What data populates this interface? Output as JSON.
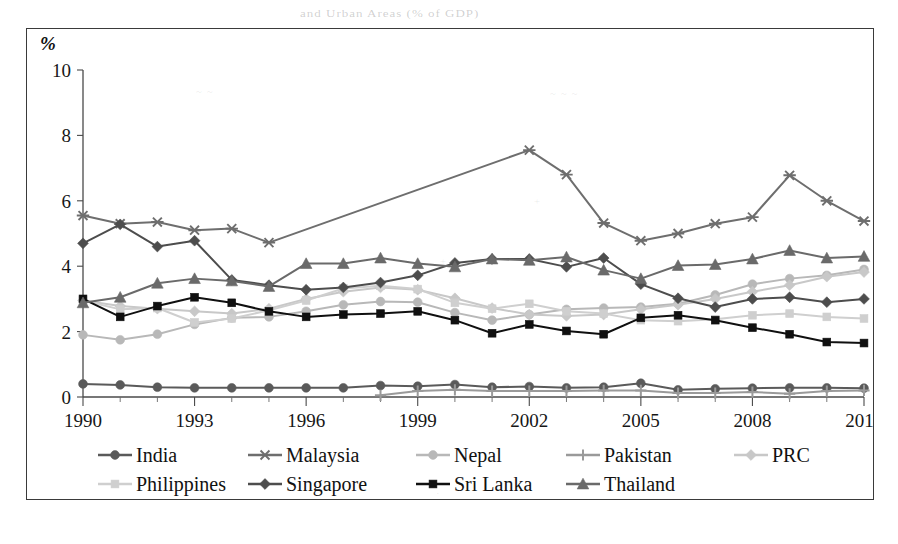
{
  "figure": {
    "percent_symbol": "%",
    "bleed_text": {
      "top": "and Urban Areas (% of GDP)",
      "a": "~ ~",
      "b": "~ ~ ~",
      "c": "+",
      "d": "+",
      "e": "·"
    }
  },
  "legend": {
    "rows": [
      [
        {
          "label": "India",
          "key": "India"
        },
        {
          "label": "Malaysia",
          "key": "Malaysia"
        },
        {
          "label": "Nepal",
          "key": "Nepal"
        },
        {
          "label": "Pakistan",
          "key": "Pakistan"
        },
        {
          "label": "PRC",
          "key": "PRC"
        }
      ],
      [
        {
          "label": "Philippines",
          "key": "Philippines"
        },
        {
          "label": "Singapore",
          "key": "Singapore"
        },
        {
          "label": "Sri Lanka",
          "key": "Sri Lanka"
        },
        {
          "label": "Thailand",
          "key": "Thailand"
        }
      ]
    ]
  },
  "chart_data": {
    "type": "line",
    "title": "",
    "subtitle": "",
    "xlabel": "",
    "ylabel": "%",
    "xlim": [
      1990,
      2011
    ],
    "ylim": [
      0,
      10
    ],
    "ytick_step": 2,
    "yticks": [
      0,
      2,
      4,
      6,
      8,
      10
    ],
    "xticks": [
      1990,
      1993,
      1996,
      1999,
      2002,
      2005,
      2008,
      2011
    ],
    "xtick_labels": [
      "1990",
      "1993",
      "1996",
      "1999",
      "2002",
      "2005",
      "2008",
      "2011"
    ],
    "xtick_minor_step": 1,
    "grid": false,
    "legend_position": "bottom",
    "x": [
      1990,
      1991,
      1992,
      1993,
      1994,
      1995,
      1996,
      1997,
      1998,
      1999,
      2000,
      2001,
      2002,
      2003,
      2004,
      2005,
      2006,
      2007,
      2008,
      2009,
      2010,
      2011
    ],
    "series": [
      {
        "name": "India",
        "color": "#5a5a5a",
        "marker": "circle",
        "x": [
          1990,
          1991,
          1992,
          1993,
          1994,
          1995,
          1996,
          1997,
          1998,
          1999,
          2000,
          2001,
          2002,
          2003,
          2004,
          2005,
          2006,
          2007,
          2008,
          2009,
          2010,
          2011
        ],
        "values": [
          0.4,
          0.37,
          0.3,
          0.28,
          0.28,
          0.28,
          0.28,
          0.28,
          0.35,
          0.33,
          0.38,
          0.3,
          0.32,
          0.28,
          0.3,
          0.42,
          0.22,
          0.25,
          0.27,
          0.28,
          0.28,
          0.27
        ]
      },
      {
        "name": "Malaysia",
        "color": "#6e6e6e",
        "marker": "asterisk",
        "x": [
          1990,
          1991,
          1992,
          1993,
          1994,
          1995,
          2002,
          2003,
          2004,
          2005,
          2006,
          2007,
          2008,
          2009,
          2010,
          2011
        ],
        "values": [
          5.55,
          5.3,
          5.35,
          5.1,
          5.15,
          4.72,
          7.55,
          6.8,
          5.32,
          4.78,
          5.0,
          5.3,
          5.5,
          6.78,
          6.0,
          5.38
        ]
      },
      {
        "name": "Nepal",
        "color": "#b8b8b8",
        "marker": "circle",
        "x": [
          1990,
          1991,
          1992,
          1993,
          1994,
          1995,
          1996,
          1997,
          1998,
          1999,
          2000,
          2001,
          2002,
          2003,
          2004,
          2005,
          2006,
          2007,
          2008,
          2009,
          2010,
          2011
        ],
        "values": [
          1.9,
          1.75,
          1.92,
          2.22,
          2.42,
          2.45,
          2.62,
          2.82,
          2.92,
          2.9,
          2.58,
          2.35,
          2.52,
          2.68,
          2.72,
          2.75,
          2.85,
          3.12,
          3.45,
          3.62,
          3.72,
          3.9
        ]
      },
      {
        "name": "Pakistan",
        "color": "#9a9a9a",
        "marker": "plus",
        "x": [
          1998,
          1999,
          2000,
          2001,
          2002,
          2003,
          2004,
          2005,
          2006,
          2007,
          2008,
          2009,
          2010,
          2011
        ],
        "values": [
          0.05,
          0.18,
          0.22,
          0.18,
          0.18,
          0.18,
          0.2,
          0.2,
          0.12,
          0.12,
          0.15,
          0.1,
          0.18,
          0.2
        ]
      },
      {
        "name": "PRC",
        "color": "#c8c8c8",
        "marker": "diamond",
        "x": [
          1990,
          1991,
          1992,
          1993,
          1994,
          1995,
          1996,
          1997,
          1998,
          1999,
          2000,
          2001,
          2002,
          2003,
          2004,
          2005,
          2006,
          2007,
          2008,
          2009,
          2010,
          2011
        ],
        "values": [
          2.95,
          2.78,
          2.7,
          2.62,
          2.55,
          2.7,
          3.0,
          3.22,
          3.35,
          3.28,
          3.02,
          2.72,
          2.52,
          2.48,
          2.52,
          2.68,
          2.82,
          3.0,
          3.22,
          3.42,
          3.68,
          3.82
        ]
      },
      {
        "name": "Philippines",
        "color": "#cfcfcf",
        "marker": "square",
        "x": [
          1990,
          1991,
          1992,
          1993,
          1994,
          1995,
          1996,
          1997,
          1998,
          1999,
          2000,
          2001,
          2002,
          2003,
          2004,
          2005,
          2006,
          2007,
          2008,
          2009,
          2010,
          2011
        ],
        "values": [
          2.95,
          2.68,
          2.72,
          2.28,
          2.4,
          2.65,
          2.95,
          3.32,
          3.4,
          3.3,
          2.88,
          2.7,
          2.85,
          2.62,
          2.55,
          2.35,
          2.32,
          2.38,
          2.5,
          2.55,
          2.45,
          2.4
        ]
      },
      {
        "name": "Singapore",
        "color": "#4d4d4d",
        "marker": "diamond",
        "x": [
          1990,
          1991,
          1992,
          1993,
          1994,
          1995,
          1996,
          1997,
          1998,
          1999,
          2000,
          2001,
          2002,
          2003,
          2004,
          2005,
          2006,
          2007,
          2008,
          2009,
          2010,
          2011
        ],
        "values": [
          4.7,
          5.28,
          4.6,
          4.78,
          3.58,
          3.42,
          3.28,
          3.35,
          3.5,
          3.72,
          4.1,
          4.22,
          4.22,
          3.98,
          4.25,
          3.45,
          3.02,
          2.75,
          3.0,
          3.05,
          2.9,
          3.0
        ]
      },
      {
        "name": "Sri Lanka",
        "color": "#101010",
        "marker": "square",
        "x": [
          1990,
          1991,
          1992,
          1993,
          1994,
          1995,
          1996,
          1997,
          1998,
          1999,
          2000,
          2001,
          2002,
          2003,
          2004,
          2005,
          2006,
          2007,
          2008,
          2009,
          2010,
          2011
        ],
        "values": [
          3.0,
          2.45,
          2.78,
          3.05,
          2.88,
          2.62,
          2.45,
          2.52,
          2.55,
          2.62,
          2.35,
          1.95,
          2.22,
          2.02,
          1.92,
          2.42,
          2.5,
          2.35,
          2.12,
          1.92,
          1.68,
          1.65
        ]
      },
      {
        "name": "Thailand",
        "color": "#6a6a6a",
        "marker": "triangle",
        "x": [
          1990,
          1991,
          1992,
          1993,
          1994,
          1995,
          1996,
          1997,
          1998,
          1999,
          2000,
          2001,
          2002,
          2003,
          2004,
          2005,
          2006,
          2007,
          2008,
          2009,
          2010,
          2011
        ],
        "values": [
          2.88,
          3.05,
          3.48,
          3.62,
          3.55,
          3.38,
          4.08,
          4.08,
          4.25,
          4.08,
          3.98,
          4.22,
          4.18,
          4.28,
          3.88,
          3.62,
          4.02,
          4.05,
          4.22,
          4.48,
          4.25,
          4.3
        ]
      }
    ]
  }
}
